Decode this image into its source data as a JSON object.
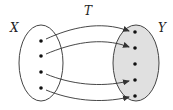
{
  "diagram": {
    "mapping_label": "T",
    "domain": {
      "label": "X",
      "points": 4,
      "fill": "#ffffff"
    },
    "codomain": {
      "label": "Y",
      "points": 5,
      "fill": "#e0e0e0"
    },
    "arrows": [
      {
        "from": 1,
        "to": 1
      },
      {
        "from": 2,
        "to": 2
      },
      {
        "from": 3,
        "to": 4
      },
      {
        "from": 4,
        "to": 5
      }
    ],
    "colors": {
      "stroke": "#333333",
      "shaded": "#e0e0e0"
    }
  }
}
